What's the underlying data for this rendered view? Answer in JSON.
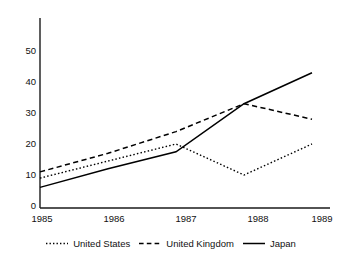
{
  "chart_data": {
    "type": "line",
    "title": "",
    "subtitle": "",
    "xlabel": "",
    "ylabel": "",
    "x": [
      1985,
      1986,
      1987,
      1988,
      1989
    ],
    "xtick_labels": [
      "1985",
      "1986",
      "1987",
      "1988",
      "1989"
    ],
    "ytick_labels": [
      "0",
      "10",
      "20",
      "30",
      "40",
      "50"
    ],
    "yticks": [
      0,
      10,
      20,
      30,
      40,
      50
    ],
    "ylim": [
      0,
      58
    ],
    "xlim": [
      1985,
      1989
    ],
    "grid": false,
    "legend_position": "bottom",
    "series": [
      {
        "name": "United States",
        "values": [
          9,
          14.5,
          20,
          10,
          20
        ],
        "style": "dotted",
        "color": "#000000"
      },
      {
        "name": "United Kingdom",
        "values": [
          11,
          17,
          24,
          33,
          28
        ],
        "style": "dashed",
        "color": "#000000"
      },
      {
        "name": "Japan",
        "values": [
          6,
          12,
          17.5,
          33,
          43
        ],
        "style": "solid",
        "color": "#000000"
      }
    ]
  },
  "legend": {
    "items": [
      {
        "label": "United States",
        "style": "dotted"
      },
      {
        "label": "United Kingdom",
        "style": "dashed"
      },
      {
        "label": "Japan",
        "style": "solid"
      }
    ]
  },
  "axes": {
    "y_tick_0": "0",
    "y_tick_1": "10",
    "y_tick_2": "20",
    "y_tick_3": "30",
    "y_tick_4": "40",
    "y_tick_5": "50",
    "x_tick_0": "1985",
    "x_tick_1": "1986",
    "x_tick_2": "1987",
    "x_tick_3": "1988",
    "x_tick_4": "1989"
  },
  "colors": {
    "axis": "#1a1a1a",
    "series": "#000000",
    "background": "#ffffff"
  }
}
